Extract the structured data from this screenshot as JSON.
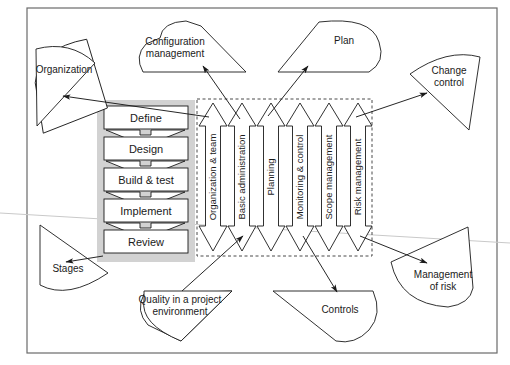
{
  "diagram": {
    "outer_frame": {
      "stroke": "#555555"
    },
    "colors": {
      "shade": "#d0d0d0",
      "box_fill": "#ffffff",
      "line": "#1a1a1a",
      "dashed": "#555555",
      "scanline": "#bdbdbd"
    }
  },
  "stages": {
    "panel_label": "process stages column",
    "items": [
      {
        "label": "Define"
      },
      {
        "label": "Design"
      },
      {
        "label": "Build & test"
      },
      {
        "label": "Implement"
      },
      {
        "label": "Review"
      }
    ]
  },
  "components": {
    "panel_label": "components dashed group",
    "items": [
      {
        "label": "Organization & team"
      },
      {
        "label": "Basic administration"
      },
      {
        "label": "Planning"
      },
      {
        "label": "Monitoring & control"
      },
      {
        "label": "Scope management"
      },
      {
        "label": "Risk management"
      }
    ]
  },
  "callouts": {
    "items": [
      {
        "id": "organization",
        "label": "Organization",
        "line1": "Organization",
        "line2": ""
      },
      {
        "id": "configuration",
        "label": "Configuration management",
        "line1": "Configuration",
        "line2": "management"
      },
      {
        "id": "plan",
        "label": "Plan",
        "line1": "Plan",
        "line2": ""
      },
      {
        "id": "change-control",
        "label": "Change control",
        "line1": "Change",
        "line2": "control"
      },
      {
        "id": "stages",
        "label": "Stages",
        "line1": "Stages",
        "line2": ""
      },
      {
        "id": "quality",
        "label": "Quality in a project environment",
        "line1": "Quality in a project",
        "line2": "environment"
      },
      {
        "id": "controls",
        "label": "Controls",
        "line1": "Controls",
        "line2": ""
      },
      {
        "id": "management-risk",
        "label": "Management of risk",
        "line1": "Management",
        "line2": "of risk"
      }
    ]
  }
}
